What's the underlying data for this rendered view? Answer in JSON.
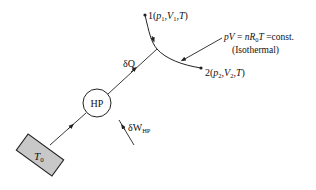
{
  "diagram": {
    "reservoir": {
      "label": "T",
      "subscript": "0",
      "fill": "#c8c8c8"
    },
    "heat_pump": {
      "label": "HP"
    },
    "heat_flow": {
      "label": "δQ"
    },
    "work_input": {
      "label": "δW",
      "subscript": "HP"
    },
    "state1": {
      "prefix": "1(",
      "p": "p",
      "p_sub": "1",
      "V": "V",
      "V_sub": "1",
      "T": "T",
      "suffix": ")"
    },
    "state2": {
      "prefix": "2(",
      "p": "p",
      "p_sub": "2",
      "V": "V",
      "V_sub": "2",
      "T": "T",
      "suffix": ")"
    },
    "process_equation": {
      "lhs": "pV",
      "eq": " = ",
      "n": "n",
      "R": "R",
      "R_sub": "0",
      "T": "T",
      "rhs": " =const."
    },
    "process_label": "(Isothermal)",
    "colors": {
      "line": "#222222",
      "background": "#ffffff"
    }
  }
}
